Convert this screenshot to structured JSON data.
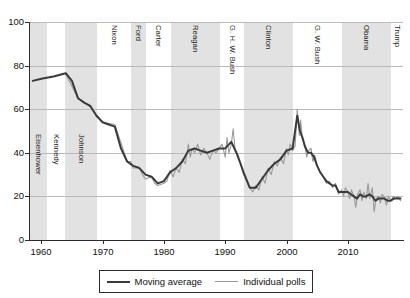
{
  "chart_data": {
    "type": "line",
    "title": "",
    "xlabel": "",
    "ylabel": "",
    "xlim": [
      1958.0,
      2019.0
    ],
    "ylim": [
      0,
      100
    ],
    "grid": "horizontal",
    "yticks": [
      0,
      20,
      40,
      60,
      80,
      100
    ],
    "xticks": [
      1960,
      1970,
      1980,
      1990,
      2000,
      2010
    ],
    "ytick_labels": [
      "0",
      "20",
      "40",
      "60",
      "80",
      "100"
    ],
    "xtick_labels": [
      "1960",
      "1970",
      "1980",
      "1990",
      "2000",
      "2010"
    ],
    "legend": {
      "position": "below-axes",
      "entries": [
        {
          "name": "Moving average",
          "color": "#3a3a3a"
        },
        {
          "name": "Individual polls",
          "color": "#9a9a9a"
        }
      ]
    },
    "bands": [
      {
        "label": "Eisenhower",
        "start": 1958.0,
        "end": 1961.0,
        "shaded": true,
        "label_align": "bottom"
      },
      {
        "label": "Kennedy",
        "start": 1961.0,
        "end": 1963.9,
        "shaded": false,
        "label_align": "bottom"
      },
      {
        "label": "Johnson",
        "start": 1963.9,
        "end": 1969.1,
        "shaded": true,
        "label_align": "bottom"
      },
      {
        "label": "Nixon",
        "start": 1969.1,
        "end": 1974.6,
        "shaded": false,
        "label_align": "top"
      },
      {
        "label": "Ford",
        "start": 1974.6,
        "end": 1977.1,
        "shaded": true,
        "label_align": "top"
      },
      {
        "label": "Carter",
        "start": 1977.1,
        "end": 1981.1,
        "shaded": false,
        "label_align": "top"
      },
      {
        "label": "Reagan",
        "start": 1981.1,
        "end": 1989.1,
        "shaded": true,
        "label_align": "top"
      },
      {
        "label": "G. H. W. Bush",
        "start": 1989.1,
        "end": 1993.1,
        "shaded": false,
        "label_align": "top"
      },
      {
        "label": "Clinton",
        "start": 1993.1,
        "end": 2001.1,
        "shaded": true,
        "label_align": "top"
      },
      {
        "label": "G. W. Bush",
        "start": 2001.1,
        "end": 2009.1,
        "shaded": false,
        "label_align": "top"
      },
      {
        "label": "Obama",
        "start": 2009.1,
        "end": 2017.1,
        "shaded": true,
        "label_align": "top"
      },
      {
        "label": "Trump",
        "start": 2017.1,
        "end": 2019.0,
        "shaded": false,
        "label_align": "top"
      }
    ],
    "series": [
      {
        "name": "Individual polls",
        "color": "#9a9a9a",
        "points": [
          [
            1964.0,
            76
          ],
          [
            1966.0,
            65
          ],
          [
            1968.0,
            61
          ],
          [
            1970.0,
            54
          ],
          [
            1972.0,
            53
          ],
          [
            1974.0,
            36
          ],
          [
            1974.6,
            36
          ],
          [
            1975.0,
            33
          ],
          [
            1976.0,
            33
          ],
          [
            1976.5,
            30
          ],
          [
            1977.0,
            28
          ],
          [
            1978.0,
            29
          ],
          [
            1978.5,
            26
          ],
          [
            1979.0,
            25
          ],
          [
            1980.0,
            26
          ],
          [
            1980.5,
            27
          ],
          [
            1981.0,
            32
          ],
          [
            1981.5,
            29
          ],
          [
            1982.0,
            33
          ],
          [
            1982.5,
            31
          ],
          [
            1983.0,
            37
          ],
          [
            1983.5,
            35
          ],
          [
            1984.0,
            44
          ],
          [
            1984.3,
            38
          ],
          [
            1984.6,
            42
          ],
          [
            1985.0,
            40
          ],
          [
            1985.5,
            44
          ],
          [
            1986.0,
            39
          ],
          [
            1986.5,
            42
          ],
          [
            1987.0,
            40
          ],
          [
            1987.5,
            37
          ],
          [
            1988.0,
            41
          ],
          [
            1988.5,
            40
          ],
          [
            1989.0,
            42
          ],
          [
            1989.5,
            44
          ],
          [
            1990.0,
            38
          ],
          [
            1990.3,
            47
          ],
          [
            1990.6,
            40
          ],
          [
            1991.0,
            44
          ],
          [
            1991.3,
            51
          ],
          [
            1991.6,
            42
          ],
          [
            1992.0,
            38
          ],
          [
            1992.5,
            35
          ],
          [
            1993.0,
            30
          ],
          [
            1993.5,
            27
          ],
          [
            1994.0,
            24
          ],
          [
            1994.5,
            22
          ],
          [
            1995.0,
            25
          ],
          [
            1995.5,
            23
          ],
          [
            1996.0,
            29
          ],
          [
            1996.5,
            26
          ],
          [
            1997.0,
            33
          ],
          [
            1997.5,
            30
          ],
          [
            1998.0,
            36
          ],
          [
            1998.5,
            34
          ],
          [
            1999.0,
            38
          ],
          [
            1999.5,
            35
          ],
          [
            2000.0,
            42
          ],
          [
            2000.3,
            39
          ],
          [
            2000.6,
            44
          ],
          [
            2001.0,
            41
          ],
          [
            2001.4,
            43
          ],
          [
            2001.75,
            60
          ],
          [
            2001.9,
            55
          ],
          [
            2002.1,
            48
          ],
          [
            2002.3,
            55
          ],
          [
            2002.6,
            46
          ],
          [
            2003.0,
            43
          ],
          [
            2003.3,
            38
          ],
          [
            2003.6,
            41
          ],
          [
            2004.0,
            42
          ],
          [
            2004.3,
            36
          ],
          [
            2004.6,
            39
          ],
          [
            2005.0,
            34
          ],
          [
            2005.5,
            31
          ],
          [
            2006.0,
            29
          ],
          [
            2006.5,
            26
          ],
          [
            2007.0,
            27
          ],
          [
            2007.5,
            24
          ],
          [
            2008.0,
            26
          ],
          [
            2008.5,
            21
          ],
          [
            2009.0,
            23
          ],
          [
            2009.3,
            20
          ],
          [
            2009.6,
            24
          ],
          [
            2010.0,
            22
          ],
          [
            2010.3,
            19
          ],
          [
            2010.6,
            23
          ],
          [
            2011.0,
            20
          ],
          [
            2011.3,
            15
          ],
          [
            2011.6,
            21
          ],
          [
            2012.0,
            23
          ],
          [
            2012.3,
            18
          ],
          [
            2012.6,
            22
          ],
          [
            2013.0,
            19
          ],
          [
            2013.3,
            26
          ],
          [
            2013.6,
            19
          ],
          [
            2014.0,
            24
          ],
          [
            2014.3,
            13
          ],
          [
            2014.6,
            19
          ],
          [
            2015.0,
            20
          ],
          [
            2015.3,
            17
          ],
          [
            2015.6,
            21
          ],
          [
            2016.0,
            19
          ],
          [
            2016.3,
            16
          ],
          [
            2016.6,
            20
          ],
          [
            2017.0,
            18
          ],
          [
            2017.4,
            20
          ],
          [
            2017.8,
            19
          ],
          [
            2018.2,
            20
          ],
          [
            2018.6,
            18
          ]
        ]
      },
      {
        "name": "Moving average",
        "color": "#3a3a3a",
        "points": [
          [
            1958.6,
            73
          ],
          [
            1960.0,
            74
          ],
          [
            1962.0,
            75
          ],
          [
            1964.0,
            76.5
          ],
          [
            1965.0,
            73
          ],
          [
            1966.0,
            65
          ],
          [
            1967.0,
            63
          ],
          [
            1968.0,
            61.5
          ],
          [
            1969.0,
            57
          ],
          [
            1970.0,
            54
          ],
          [
            1971.0,
            53
          ],
          [
            1972.0,
            52
          ],
          [
            1973.0,
            42
          ],
          [
            1974.0,
            36
          ],
          [
            1975.0,
            34
          ],
          [
            1976.0,
            33
          ],
          [
            1977.0,
            30
          ],
          [
            1978.0,
            29
          ],
          [
            1979.0,
            26
          ],
          [
            1980.0,
            27
          ],
          [
            1981.0,
            31
          ],
          [
            1982.0,
            33
          ],
          [
            1983.0,
            36
          ],
          [
            1984.0,
            41
          ],
          [
            1985.0,
            42
          ],
          [
            1986.0,
            41
          ],
          [
            1987.0,
            40
          ],
          [
            1988.0,
            41
          ],
          [
            1989.0,
            42
          ],
          [
            1990.0,
            42
          ],
          [
            1991.0,
            45
          ],
          [
            1992.0,
            39
          ],
          [
            1993.0,
            31
          ],
          [
            1994.0,
            24
          ],
          [
            1995.0,
            24
          ],
          [
            1996.0,
            28
          ],
          [
            1997.0,
            32
          ],
          [
            1998.0,
            35
          ],
          [
            1999.0,
            37
          ],
          [
            2000.0,
            41
          ],
          [
            2001.0,
            42
          ],
          [
            2001.75,
            57
          ],
          [
            2002.2,
            50
          ],
          [
            2002.6,
            47
          ],
          [
            2003.0,
            43
          ],
          [
            2003.5,
            40
          ],
          [
            2004.0,
            40
          ],
          [
            2004.5,
            38
          ],
          [
            2005.0,
            34
          ],
          [
            2005.5,
            31
          ],
          [
            2006.0,
            29
          ],
          [
            2006.5,
            27
          ],
          [
            2007.0,
            26
          ],
          [
            2007.5,
            25
          ],
          [
            2008.0,
            25
          ],
          [
            2008.5,
            22
          ],
          [
            2009.0,
            22
          ],
          [
            2009.5,
            22
          ],
          [
            2010.0,
            22
          ],
          [
            2010.5,
            21
          ],
          [
            2011.0,
            20
          ],
          [
            2011.5,
            19
          ],
          [
            2012.0,
            21
          ],
          [
            2012.5,
            20
          ],
          [
            2013.0,
            20
          ],
          [
            2013.5,
            21
          ],
          [
            2014.0,
            20
          ],
          [
            2014.5,
            18
          ],
          [
            2015.0,
            19
          ],
          [
            2015.5,
            19
          ],
          [
            2016.0,
            19
          ],
          [
            2016.5,
            18
          ],
          [
            2017.0,
            18
          ],
          [
            2017.5,
            19
          ],
          [
            2018.0,
            19
          ],
          [
            2018.6,
            19
          ]
        ]
      }
    ]
  }
}
